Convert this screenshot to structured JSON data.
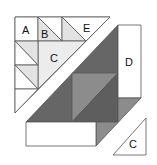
{
  "diagram": {
    "colors": {
      "background": "#ffffff",
      "outline": "#555555",
      "white": "#ffffff",
      "light": "#e6e6e6",
      "lighter": "#efefef",
      "medium": "#8c8c8c",
      "dark": "#6a6a6a",
      "darker": "#5e5e5e"
    },
    "labels": {
      "a": "A",
      "b": "B",
      "c_top": "C",
      "d": "D",
      "e": "E",
      "c_bottom": "C"
    }
  }
}
